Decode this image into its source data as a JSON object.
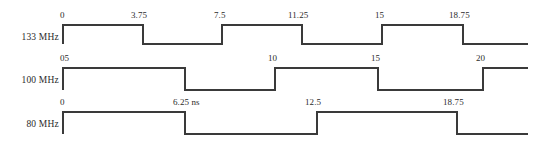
{
  "figure": {
    "type": "timing-diagram",
    "background_color": "#ffffff",
    "line_color": "#3a3a3a",
    "text_color": "#2b2b2b",
    "time_unit": "ns",
    "width": 533,
    "height": 143
  },
  "signals": [
    {
      "name": "133 MHz",
      "label": "133 MHz",
      "label_x": 14,
      "label_y": 32,
      "label_width": 45,
      "start_x": 63,
      "end_x": 528,
      "high_y": 25,
      "low_y": 44,
      "starts_high": true,
      "edges_x": [
        143,
        222,
        302,
        382,
        463
      ],
      "ticks": [
        {
          "text": "0",
          "x": 60,
          "y": 10
        },
        {
          "text": "3.75",
          "x": 131,
          "y": 10
        },
        {
          "text": "7.5",
          "x": 214,
          "y": 10
        },
        {
          "text": "11.25",
          "x": 288,
          "y": 10
        },
        {
          "text": "15",
          "x": 375,
          "y": 10
        },
        {
          "text": "18.75",
          "x": 449,
          "y": 10
        }
      ]
    },
    {
      "name": "100 MHz",
      "label": "100 MHz",
      "label_x": 14,
      "label_y": 75,
      "label_width": 45,
      "start_x": 63,
      "end_x": 528,
      "high_y": 68,
      "low_y": 90,
      "starts_high": true,
      "edges_x": [
        185,
        275,
        378,
        483
      ],
      "ticks": [
        {
          "text": "05",
          "x": 60,
          "y": 53
        },
        {
          "text": "10",
          "x": 268,
          "y": 53
        },
        {
          "text": "15",
          "x": 371,
          "y": 53
        },
        {
          "text": "20",
          "x": 476,
          "y": 53
        }
      ]
    },
    {
      "name": "80 MHz",
      "label": "80 MHz",
      "label_x": 14,
      "label_y": 119,
      "label_width": 45,
      "start_x": 63,
      "end_x": 528,
      "high_y": 112,
      "low_y": 134,
      "starts_high": true,
      "edges_x": [
        185,
        317,
        457
      ],
      "ticks": [
        {
          "text": "0",
          "x": 60,
          "y": 97
        },
        {
          "text": "6.25 ns",
          "x": 173,
          "y": 97
        },
        {
          "text": "12.5",
          "x": 305,
          "y": 97
        },
        {
          "text": "18.75",
          "x": 443,
          "y": 97
        }
      ]
    }
  ]
}
